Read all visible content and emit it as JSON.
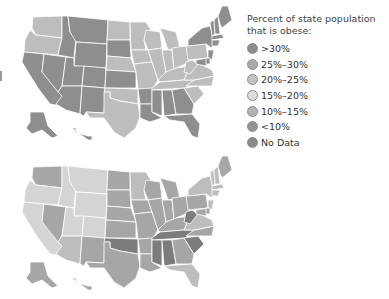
{
  "legend": {
    "title": "Percent of state population that is obese:",
    "items": [
      {
        "key": "c1",
        "label": ">30%",
        "color": "#8c8c8c"
      },
      {
        "key": "c2",
        "label": "25%–30%",
        "color": "#a9a9a9"
      },
      {
        "key": "c3",
        "label": "20%–25%",
        "color": "#c2c2c2"
      },
      {
        "key": "c4",
        "label": "15%–20%",
        "color": "#dcdcdc"
      },
      {
        "key": "c5",
        "label": "10%–15%",
        "color": "#b3b3b3"
      },
      {
        "key": "c6",
        "label": "<10%",
        "color": "#949494"
      },
      {
        "key": "c7",
        "label": "No Data",
        "color": "#8a8a8a"
      }
    ]
  },
  "maps": [
    {
      "id": "map-top",
      "states": {
        "WA": "c3",
        "OR": "c3",
        "CA": "c7",
        "NV": "c7",
        "ID": "c7",
        "MT": "c7",
        "WY": "c7",
        "UT": "c7",
        "CO": "c7",
        "AZ": "c7",
        "NM": "c7",
        "ND": "c3",
        "SD": "c7",
        "NE": "c3",
        "KS": "c7",
        "OK": "c3",
        "TX": "c3",
        "MN": "c3",
        "IA": "c3",
        "MO": "c3",
        "AR": "c7",
        "LA": "c7",
        "WI": "c3",
        "IL": "c3",
        "MI": "c3",
        "IN": "c3",
        "OH": "c3",
        "KY": "c3",
        "TN": "c3",
        "MS": "c7",
        "AL": "c7",
        "GA": "c7",
        "FL": "c7",
        "SC": "c3",
        "NC": "c3",
        "VA": "c3",
        "WV": "c3",
        "PA": "c3",
        "NY": "c7",
        "VT": "c7",
        "NH": "c7",
        "ME": "c7",
        "MA": "c7",
        "CT": "c7",
        "NJ": "c7",
        "MD": "c7",
        "DE": "c7",
        "AK": "c7",
        "HI": "c7"
      }
    },
    {
      "id": "map-bottom",
      "states": {
        "WA": "c2",
        "OR": "c4",
        "CA": "c4",
        "NV": "c2",
        "ID": "c4",
        "MT": "c4",
        "WY": "c4",
        "UT": "c4",
        "CO": "c4",
        "AZ": "c3",
        "NM": "c2",
        "ND": "c2",
        "SD": "c2",
        "NE": "c2",
        "KS": "c2",
        "OK": "c1",
        "TX": "c2",
        "MN": "c3",
        "IA": "c2",
        "MO": "c2",
        "AR": "c2",
        "LA": "c2",
        "WI": "c2",
        "IL": "c2",
        "MI": "c2",
        "IN": "c2",
        "OH": "c2",
        "KY": "c2",
        "TN": "c1",
        "MS": "c1",
        "AL": "c1",
        "GA": "c2",
        "FL": "c3",
        "SC": "c1",
        "NC": "c2",
        "VA": "c3",
        "WV": "c1",
        "PA": "c2",
        "NY": "c3",
        "VT": "c3",
        "NH": "c3",
        "ME": "c2",
        "MA": "c3",
        "CT": "c3",
        "NJ": "c3",
        "MD": "c2",
        "DE": "c2",
        "AK": "c2",
        "HI": "c2"
      }
    }
  ],
  "map_colors": {
    "c1": "#7c7c7c",
    "c2": "#a6a6a6",
    "c3": "#bdbdbd",
    "c4": "#d4d4d4",
    "c7": "#8e8e8e"
  }
}
